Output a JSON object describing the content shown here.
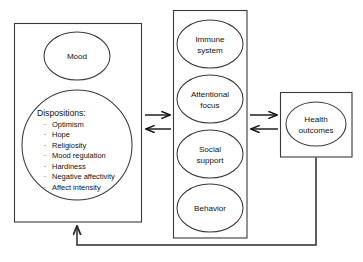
{
  "diagram": {
    "background_color": "#ffffff",
    "line_color": "#3a3a3a",
    "arrow_color": "#111111",
    "text_color": "#111111"
  },
  "left_panel": {
    "name": "dispositions-panel",
    "mood_node": {
      "label": "Mood"
    },
    "dispositions_node": {
      "heading": "Dispositions:",
      "items": [
        "Optimism",
        "Hope",
        "Religiosity",
        "Mood regulation",
        "Hardiness",
        "Negative affectivity",
        "Affect intensity"
      ],
      "bullet_glyph": "·"
    }
  },
  "middle_panel": {
    "name": "mediators-panel",
    "nodes": [
      {
        "label_line1": "Immune",
        "label_line2": "system"
      },
      {
        "label_line1": "Attentional",
        "label_line2": "focus"
      },
      {
        "label_line1": "Social",
        "label_line2": "support"
      },
      {
        "label_line1": "Behavior",
        "label_line2": ""
      }
    ]
  },
  "right_panel": {
    "name": "health-outcomes-panel",
    "node": {
      "label_line1": "Health",
      "label_line2": "outcomes"
    }
  },
  "connectors": [
    {
      "name": "dispositions-to-mediators-arrow",
      "direction": "right"
    },
    {
      "name": "mediators-to-dispositions-arrow",
      "direction": "left"
    },
    {
      "name": "mediators-to-health-arrow",
      "direction": "right"
    },
    {
      "name": "health-to-mediators-arrow",
      "direction": "left"
    },
    {
      "name": "health-feedback-to-dispositions-arrow",
      "direction": "up"
    }
  ]
}
